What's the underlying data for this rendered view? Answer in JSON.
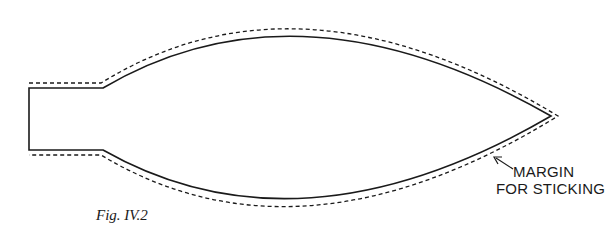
{
  "figure": {
    "caption": "Fig. IV.2",
    "annotation": {
      "line1": "MARGIN",
      "line2": "FOR STICKING"
    },
    "shape": "balloon/envelope outline with neck (solid) and sticking margin (dashed)",
    "colors": {
      "stroke": "#1a1a1a",
      "background": "#ffffff"
    }
  }
}
